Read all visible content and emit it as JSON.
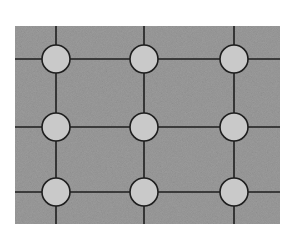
{
  "diagram": {
    "type": "grid-lattice",
    "panel": {
      "x": 15,
      "y": 26,
      "width": 265,
      "height": 198
    },
    "columns_x": [
      56,
      144,
      234
    ],
    "rows_y": [
      59,
      127,
      192
    ],
    "node_radius": 14,
    "nodes": [
      {
        "row": 0,
        "col": 0
      },
      {
        "row": 0,
        "col": 1
      },
      {
        "row": 0,
        "col": 2
      },
      {
        "row": 1,
        "col": 0
      },
      {
        "row": 1,
        "col": 1
      },
      {
        "row": 1,
        "col": 2
      },
      {
        "row": 2,
        "col": 0
      },
      {
        "row": 2,
        "col": 1
      },
      {
        "row": 2,
        "col": 2
      }
    ],
    "colors": {
      "background": "#ffffff",
      "panel": "#9c9c9c",
      "node_fill": "#c9c9c9",
      "line": "#1e1e1e"
    }
  }
}
